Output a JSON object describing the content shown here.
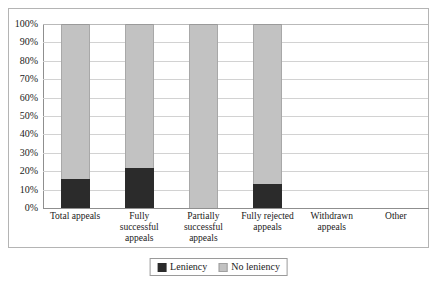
{
  "chart_data": {
    "type": "bar",
    "subtype": "stacked-percent",
    "title": "",
    "xlabel": "",
    "ylabel": "",
    "ylim": [
      0,
      100
    ],
    "ytick_labels": [
      "100%",
      "90%",
      "80%",
      "70%",
      "60%",
      "50%",
      "40%",
      "30%",
      "20%",
      "10%",
      "0%"
    ],
    "ytick_values": [
      100,
      90,
      80,
      70,
      60,
      50,
      40,
      30,
      20,
      10,
      0
    ],
    "grid": true,
    "legend_position": "bottom-center",
    "categories": [
      "Total appeals",
      "Fully successful appeals",
      "Partially successful appeals",
      "Fully rejected appeals",
      "Withdrawn appeals",
      "Other"
    ],
    "category_lines": [
      [
        "Total appeals"
      ],
      [
        "Fully",
        "successful",
        "appeals"
      ],
      [
        "Partially",
        "successful",
        "appeals"
      ],
      [
        "Fully rejected",
        "appeals"
      ],
      [
        "Withdrawn",
        "appeals"
      ],
      [
        "Other"
      ]
    ],
    "series": [
      {
        "name": "Leniency",
        "color": "#2b2b2b",
        "values": [
          16,
          22,
          0,
          13,
          null,
          null
        ]
      },
      {
        "name": "No leniency",
        "color": "#c2c2c2",
        "values": [
          84,
          78,
          100,
          87,
          null,
          null
        ]
      }
    ]
  },
  "legend": {
    "items": [
      {
        "label": "Leniency",
        "swatch": "leniency-swatch"
      },
      {
        "label": "No leniency",
        "swatch": "no-leniency-swatch"
      }
    ]
  }
}
